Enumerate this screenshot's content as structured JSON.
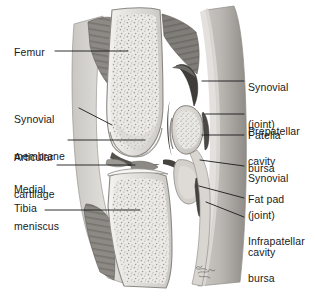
{
  "figure": {
    "artist_signature": "Netter",
    "background_color": "#ffffff",
    "ink_color": "#1a1a1a"
  },
  "labels_left": [
    {
      "id": "femur",
      "text": "Femur",
      "lines": [
        "Femur"
      ],
      "x": 14,
      "y": 46
    },
    {
      "id": "synovial-membrane",
      "text": "Synovial membrane",
      "lines": [
        "Synovial",
        "membrane"
      ],
      "x": 14,
      "y": 89
    },
    {
      "id": "articular-cartilage",
      "text": "Articular cartilage",
      "lines": [
        "Articular",
        "cartilage"
      ],
      "x": 14,
      "y": 127
    },
    {
      "id": "medial-meniscus",
      "text": "Medial meniscus",
      "lines": [
        "Medial",
        "meniscus"
      ],
      "x": 14,
      "y": 159
    },
    {
      "id": "tibia",
      "text": "Tibia",
      "lines": [
        "Tibia"
      ],
      "x": 14,
      "y": 202
    }
  ],
  "labels_right": [
    {
      "id": "synovial-cavity-upper",
      "text": "Synovial (joint) cavity",
      "lines": [
        "Synovial",
        "(joint)",
        "cavity"
      ],
      "x": 248,
      "y": 57
    },
    {
      "id": "prepatellar-bursa",
      "text": "Prepatellar bursa",
      "lines": [
        "Prepatellar",
        "bursa"
      ],
      "x": 248,
      "y": 101
    },
    {
      "id": "patella",
      "text": "Patella",
      "lines": [
        "Patella"
      ],
      "x": 248,
      "y": 129
    },
    {
      "id": "synovial-cavity-lower",
      "text": "Synovial (joint) cavity",
      "lines": [
        "Synovial",
        "(joint)",
        "cavity"
      ],
      "x": 248,
      "y": 148
    },
    {
      "id": "fat-pad",
      "text": "Fat pad",
      "lines": [
        "Fat pad"
      ],
      "x": 248,
      "y": 193
    },
    {
      "id": "infrapatellar-bursa",
      "text": "Infrapatellar bursa",
      "lines": [
        "Infrapatellar",
        "bursa"
      ],
      "x": 248,
      "y": 211
    }
  ],
  "leaders_left": [
    {
      "id": "leader-femur",
      "points": "55,51 128,51"
    },
    {
      "id": "leader-synovial-membrane",
      "points": "79,108 112,125"
    },
    {
      "id": "leader-articular-cartilage",
      "points": "68,140 145,140"
    },
    {
      "id": "leader-medial-meniscus",
      "points": "57,165 135,165"
    },
    {
      "id": "leader-tibia",
      "points": "45,210 140,210"
    }
  ],
  "leaders_right": [
    {
      "id": "leader-synovial-cavity-upper",
      "points": "244,81 202,81"
    },
    {
      "id": "leader-prepatellar-bursa",
      "points": "244,114 205,114"
    },
    {
      "id": "leader-patella",
      "points": "244,135 202,135"
    },
    {
      "id": "leader-synovial-cavity-lower",
      "points": "244,166 200,160"
    },
    {
      "id": "leader-fat-pad",
      "points": "244,198 199,186"
    },
    {
      "id": "leader-infrapatellar-bursa",
      "points": "244,217 206,202"
    }
  ],
  "anatomy_regions": [
    {
      "id": "femur-shaft",
      "name": "Femur shaft",
      "tone": "#e8e6e2"
    },
    {
      "id": "femoral-condyle",
      "name": "Femoral condyle",
      "tone": "#e6e4e0"
    },
    {
      "id": "patella-body",
      "name": "Patella",
      "tone": "#ddd9d4"
    },
    {
      "id": "tibia-body",
      "name": "Tibia",
      "tone": "#e6e3df"
    },
    {
      "id": "quadriceps-muscle",
      "name": "Quadriceps muscle",
      "tone": "#7d7a77"
    },
    {
      "id": "gastroc-muscle",
      "name": "Posterior muscle",
      "tone": "#6f6c69"
    },
    {
      "id": "skin-soft-tissue",
      "name": "Skin and soft tissue",
      "tone": "#b9b6b2"
    },
    {
      "id": "joint-cavity-space",
      "name": "Synovial joint cavity",
      "tone": "#4a4845"
    },
    {
      "id": "fat-pad-region",
      "name": "Infrapatellar fat pad",
      "tone": "#cfcbc6"
    },
    {
      "id": "meniscus-wedge",
      "name": "Medial meniscus",
      "tone": "#9b9894"
    }
  ]
}
